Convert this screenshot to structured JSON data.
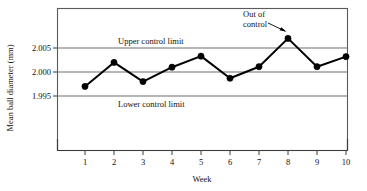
{
  "chart_data": {
    "type": "line",
    "title": "",
    "xlabel": "Week",
    "ylabel": "Mean ball diameter (mm)",
    "categories": [
      "1",
      "2",
      "3",
      "4",
      "5",
      "6",
      "7",
      "8",
      "9",
      "10"
    ],
    "x": [
      1,
      2,
      3,
      4,
      5,
      6,
      7,
      8,
      9,
      10
    ],
    "values": [
      1.997,
      2.002,
      1.998,
      2.001,
      2.0033,
      1.9987,
      2.0011,
      2.007,
      2.0011,
      2.0032
    ],
    "series": [
      {
        "name": "Mean ball diameter",
        "values": [
          1.997,
          2.002,
          1.998,
          2.001,
          2.0033,
          1.9987,
          2.0011,
          2.007,
          2.0011,
          2.0032
        ]
      }
    ],
    "ylim": [
      1.9895,
      2.0085
    ],
    "xlim": [
      0.45,
      10.55
    ],
    "yticks": [
      2.005,
      2.0,
      1.995
    ],
    "ytick_labels": [
      "2.005",
      "2.000",
      "1.995"
    ],
    "xticks": [
      1,
      2,
      3,
      4,
      5,
      6,
      7,
      8,
      9,
      10
    ],
    "grid": "horizontal",
    "legend": "none",
    "reference_lines": [
      {
        "name": "upper_control_limit",
        "label": "Upper control limit",
        "value": 2.005
      },
      {
        "name": "center_line",
        "label": "",
        "value": 2.0
      },
      {
        "name": "lower_control_limit",
        "label": "Lower control limit",
        "value": 1.995
      }
    ],
    "annotations": [
      {
        "name": "out-of-control",
        "text_line1": "Out of",
        "text_line2": "control",
        "points_to_x": 8,
        "points_to_y": 2.007
      }
    ],
    "colors": {
      "line": "#000000",
      "marker": "#000000",
      "gridline": "#6e6e6e",
      "frame": "#5a5a5a",
      "background": "#ffffff"
    }
  },
  "axis": {
    "y_title": "Mean ball diameter (mm)",
    "x_title": "Week",
    "y_tick_1": "2.005",
    "y_tick_2": "2.000",
    "y_tick_3": "1.995",
    "x_tick_1": "1",
    "x_tick_2": "2",
    "x_tick_3": "3",
    "x_tick_4": "4",
    "x_tick_5": "5",
    "x_tick_6": "6",
    "x_tick_7": "7",
    "x_tick_8": "8",
    "x_tick_9": "9",
    "x_tick_10": "10"
  },
  "labels": {
    "upper_control_limit": "Upper control limit",
    "lower_control_limit": "Lower control limit",
    "out_of_control_line1": "Out of",
    "out_of_control_line2": "control"
  }
}
